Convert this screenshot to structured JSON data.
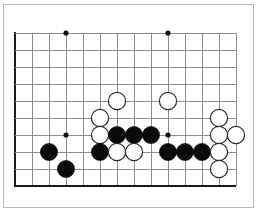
{
  "figure": {
    "board_type": "go-board",
    "colors": {
      "background": "#ffffff",
      "grid_line": "#8c8c8c",
      "board_edge": "#1a1a1a",
      "black_stone": "#0b0b0b",
      "white_stone": "#ffffff",
      "white_stone_border": "#2b2b2b",
      "frame_border": "#b9b9b9"
    }
  },
  "grid": {
    "origin_x": 15,
    "origin_y": 33,
    "spacing": 17,
    "columns": 14,
    "rows": 10,
    "left_edge_is_board_edge": true,
    "bottom_edge_is_board_edge": true,
    "top_edge_is_board_edge": false,
    "right_edge_is_board_edge": false,
    "column_labels": [
      "c0",
      "c1",
      "c2",
      "c3",
      "c4",
      "c5",
      "c6",
      "c7",
      "c8",
      "c9",
      "c10",
      "c11",
      "c12",
      "c13"
    ],
    "row_labels": [
      "r0",
      "r1",
      "r2",
      "r3",
      "r4",
      "r5",
      "r6",
      "r7",
      "r8",
      "r9"
    ]
  },
  "hoshi_points": [
    {
      "col": 3,
      "row": 0
    },
    {
      "col": 9,
      "row": 0
    },
    {
      "col": 3,
      "row": 6
    },
    {
      "col": 9,
      "row": 6
    }
  ],
  "stones": [
    {
      "color": "white",
      "col": 6,
      "row": 4
    },
    {
      "color": "white",
      "col": 9,
      "row": 4
    },
    {
      "color": "white",
      "col": 5,
      "row": 5
    },
    {
      "color": "white",
      "col": 12,
      "row": 5
    },
    {
      "color": "white",
      "col": 5,
      "row": 6
    },
    {
      "color": "black",
      "col": 6,
      "row": 6
    },
    {
      "color": "black",
      "col": 7,
      "row": 6
    },
    {
      "color": "black",
      "col": 8,
      "row": 6
    },
    {
      "color": "white",
      "col": 12,
      "row": 6
    },
    {
      "color": "white",
      "col": 13,
      "row": 6
    },
    {
      "color": "black",
      "col": 2,
      "row": 7
    },
    {
      "color": "black",
      "col": 5,
      "row": 7
    },
    {
      "color": "white",
      "col": 6,
      "row": 7
    },
    {
      "color": "white",
      "col": 7,
      "row": 7
    },
    {
      "color": "black",
      "col": 9,
      "row": 7
    },
    {
      "color": "black",
      "col": 10,
      "row": 7
    },
    {
      "color": "black",
      "col": 11,
      "row": 7
    },
    {
      "color": "white",
      "col": 12,
      "row": 7
    },
    {
      "color": "black",
      "col": 3,
      "row": 8
    },
    {
      "color": "white",
      "col": 12,
      "row": 8
    }
  ],
  "counts": {
    "black_stones": 9,
    "white_stones": 11,
    "total_stones": 20
  }
}
